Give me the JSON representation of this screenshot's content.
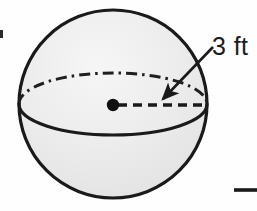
{
  "figure": {
    "kind": "geometry-diagram",
    "shape_name": "sphere",
    "caption_label": "3 ft",
    "measure": {
      "value": "3",
      "unit": "ft",
      "text": "3 ft",
      "measures": "radius"
    },
    "colors": {
      "outline": "#1a1a1a",
      "fill": "#e9e9e9",
      "fill_highlight": "#f4f4f4",
      "label_text": "#1b1b1b",
      "background": "#fefefe"
    },
    "geometry": {
      "circle": {
        "cx": 113,
        "cy": 104,
        "r": 94
      },
      "equator_ellipse": {
        "cx": 113,
        "cy": 104,
        "rx": 94,
        "ry": 31
      },
      "center_dot": {
        "cx": 113,
        "cy": 105,
        "r": 6
      },
      "radius_line": {
        "x1": 113,
        "y1": 105,
        "x2": 206,
        "y2": 105
      },
      "leader_arrow": {
        "x1": 212,
        "y1": 48,
        "x2": 160,
        "y2": 101
      },
      "rule_segment": {
        "x1": 235,
        "y1": 190,
        "x2": 257,
        "y2": 190
      },
      "edge_tick": {
        "x": 0,
        "y": 30,
        "w": 3,
        "h": 8
      }
    },
    "parts": [
      {
        "name": "sphere-outline",
        "style": "solid",
        "description": "circle silhouette of the sphere"
      },
      {
        "name": "equator-back-arc",
        "style": "dash-dot",
        "description": "hidden rear half of the equator ellipse"
      },
      {
        "name": "equator-front-arc",
        "style": "solid",
        "description": "visible front half of the equator ellipse"
      },
      {
        "name": "radius-line",
        "style": "dashed",
        "description": "radius drawn from center to the rim"
      },
      {
        "name": "center-dot",
        "style": "filled",
        "description": "marks the center of the sphere"
      },
      {
        "name": "leader-arrow",
        "style": "solid-with-arrowhead",
        "description": "points from the label to the radius"
      }
    ]
  }
}
